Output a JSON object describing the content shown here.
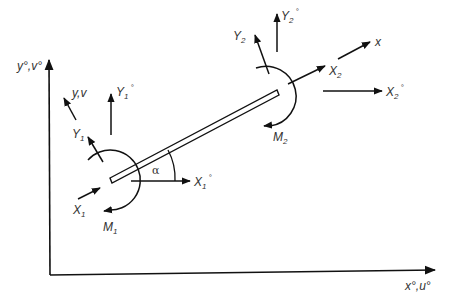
{
  "diagram": {
    "type": "beam-element-force-diagram",
    "colors": {
      "stroke": "#111111",
      "text": "#333333",
      "background": "#ffffff"
    },
    "global_axes": {
      "y_label": "y°,v°",
      "x_label": "x°,u°"
    },
    "local_axes": {
      "y_label": "y,v",
      "x_label": "x"
    },
    "node1": {
      "Y_label": "Y",
      "Y_sub": "1",
      "Y_global_label": "Y",
      "Y_global_sub": "1",
      "Y_global_sup": "°",
      "X_label": "X",
      "X_sub": "1",
      "X_global_label": "X",
      "X_global_sub": "1",
      "X_global_sup": "°",
      "M_label": "M",
      "M_sub": "1"
    },
    "node2": {
      "Y_label": "Y",
      "Y_sub": "2",
      "Y_global_label": "Y",
      "Y_global_sub": "2",
      "Y_global_sup": "°",
      "X_label": "X",
      "X_sub": "2",
      "X_global_label": "X",
      "X_global_sub": "2",
      "X_global_sup": "°",
      "M_label": "M",
      "M_sub": "2"
    },
    "angle_label": "α"
  }
}
